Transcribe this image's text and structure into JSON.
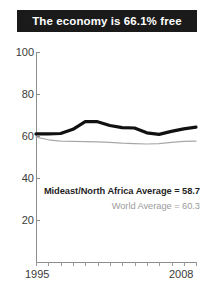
{
  "title": {
    "text": "The economy is 66.1% free"
  },
  "annotations": {
    "mideast": "Mideast/North Africa Average = 58.7",
    "world": "World Average = 60.3"
  },
  "axis": {
    "y_ticks": [
      "100",
      "80",
      "60",
      "40",
      "20"
    ],
    "x_start_label": "1995",
    "x_end_label": "2008"
  },
  "colors": {
    "banner_bg": "#1a1a1a",
    "banner_text": "#ffffff",
    "series_mideast": "#111111",
    "series_world": "#a8a8a8",
    "axis": "#8d8d8d",
    "tick_text": "#3b3b3b"
  },
  "chart_data": {
    "type": "line",
    "title": "The economy is 66.1% free",
    "xlabel": "",
    "ylabel": "",
    "xlim": [
      1995,
      2008
    ],
    "ylim": [
      0,
      100
    ],
    "yticks": [
      20,
      40,
      60,
      80,
      100
    ],
    "xticks": [
      1995,
      1996,
      1997,
      1998,
      1999,
      2000,
      2001,
      2002,
      2003,
      2004,
      2005,
      2006,
      2007,
      2008
    ],
    "grid": false,
    "legend": "none",
    "x": [
      1995,
      1996,
      1997,
      1998,
      1999,
      2000,
      2001,
      2002,
      2003,
      2004,
      2005,
      2006,
      2007,
      2008
    ],
    "series": [
      {
        "name": "Mideast/North Africa Average",
        "color": "#111111",
        "linewidth": 3,
        "values": [
          61.0,
          61.0,
          61.2,
          63.2,
          66.8,
          66.8,
          65.0,
          64.0,
          63.8,
          61.5,
          60.8,
          62.2,
          63.4,
          64.2
        ]
      },
      {
        "name": "World Average",
        "color": "#a8a8a8",
        "linewidth": 1,
        "values": [
          59.5,
          58.2,
          57.6,
          57.4,
          57.3,
          57.2,
          57.0,
          56.6,
          56.4,
          56.2,
          56.4,
          57.0,
          57.4,
          57.6
        ]
      }
    ],
    "annotations": [
      {
        "text": "Mideast/North Africa Average = 58.7",
        "value": 58.7
      },
      {
        "text": "World Average = 60.3",
        "value": 60.3
      }
    ]
  }
}
